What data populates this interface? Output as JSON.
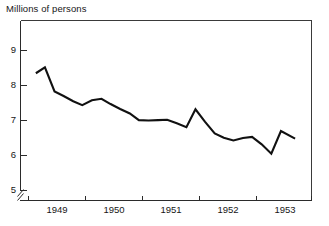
{
  "chart_data": {
    "type": "line",
    "title": "Millions of persons",
    "xlabel": "",
    "ylabel": "",
    "ylim": [
      5,
      9.45
    ],
    "xlim": [
      1948.75,
      1953.75
    ],
    "grid": false,
    "legend": "none",
    "y_axis_break": true,
    "y_ticks": [
      5,
      6,
      7,
      8,
      9
    ],
    "y_tick_labels": [
      "5",
      "6",
      "7",
      "8",
      "9"
    ],
    "x_ticks": [
      1948.75,
      1949.75,
      1950.75,
      1951.75,
      1952.75,
      1953.75
    ],
    "x_tick_labels": [
      "",
      "",
      "",
      "",
      "",
      ""
    ],
    "x_category_labels": [
      "1949",
      "1950",
      "1951",
      "1952",
      "1953"
    ],
    "x_category_positions": [
      1949.25,
      1950.25,
      1951.25,
      1952.25,
      1953.25
    ],
    "series": [
      {
        "name": "Millions of persons",
        "color": "#111111",
        "x": [
          1948.88,
          1949.04,
          1949.21,
          1949.37,
          1949.54,
          1949.7,
          1949.87,
          1950.04,
          1950.2,
          1950.37,
          1950.54,
          1950.7,
          1950.87,
          1951.04,
          1951.2,
          1951.37,
          1951.54,
          1951.7,
          1951.87,
          1952.04,
          1952.2,
          1952.37,
          1952.54,
          1952.7,
          1952.87,
          1953.04,
          1953.21,
          1953.46
        ],
        "values": [
          8.35,
          8.52,
          7.83,
          7.7,
          7.55,
          7.44,
          7.58,
          7.62,
          7.47,
          7.33,
          7.2,
          7.01,
          7.0,
          7.01,
          7.02,
          6.92,
          6.81,
          7.32,
          6.96,
          6.63,
          6.51,
          6.43,
          6.5,
          6.53,
          6.32,
          6.05,
          6.7,
          6.48
        ]
      }
    ]
  },
  "title": {
    "text": "Millions of persons"
  },
  "axes": {
    "y_labels": [
      "9",
      "8",
      "7",
      "6",
      "5"
    ],
    "x_labels": [
      "1949",
      "1950",
      "1951",
      "1952",
      "1953"
    ]
  },
  "colors": {
    "line": "#111111",
    "axis": "#2b2b2b",
    "frame": "#3a3a3a",
    "background": "#ffffff",
    "text": "#161616"
  }
}
